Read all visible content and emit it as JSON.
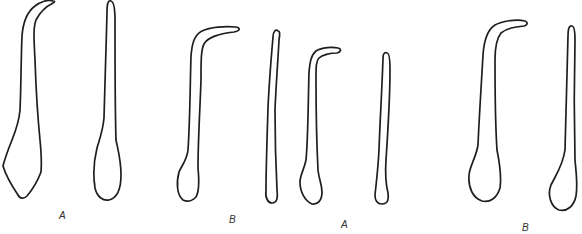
{
  "figure": {
    "stroke_color": "#1e1e1e",
    "background": "#ffffff",
    "panels": [
      {
        "label": "A",
        "items": [
          "hooked-form",
          "club-form"
        ]
      },
      {
        "label": "B",
        "items": [
          "hooked-form",
          "club-form"
        ]
      },
      {
        "label": "A",
        "items": [
          "hooked-form",
          "club-form"
        ]
      },
      {
        "label": "B",
        "items": [
          "hooked-form",
          "club-form"
        ]
      }
    ]
  }
}
